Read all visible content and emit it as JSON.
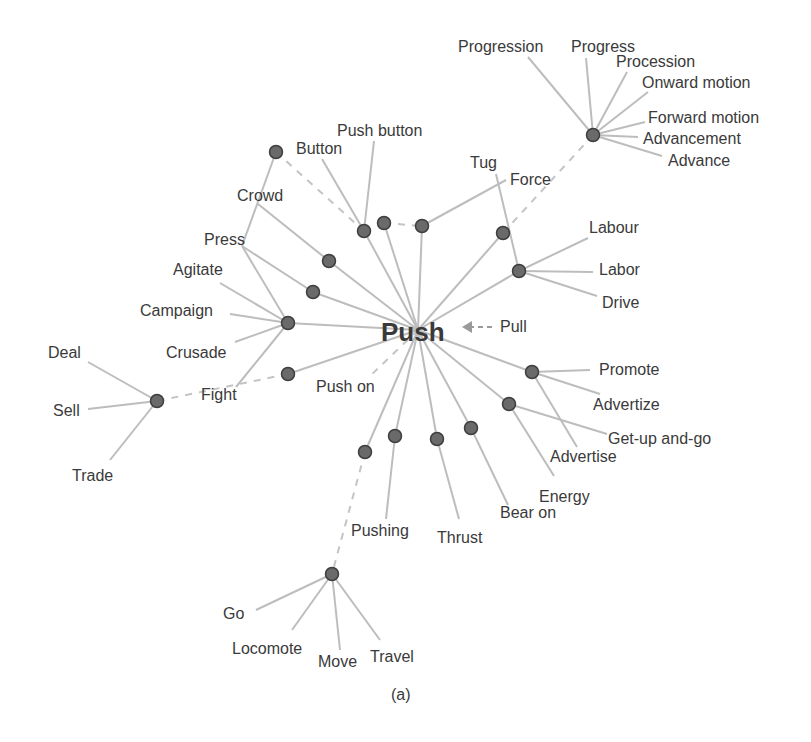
{
  "diagram": {
    "caption": "(a)",
    "center": {
      "id": "push",
      "label": "Push",
      "x": 418,
      "y": 330
    },
    "antonym": {
      "label": "Pull",
      "x": 500,
      "y": 332,
      "arrow_from": [
        492,
        327
      ],
      "arrow_to": [
        462,
        327
      ]
    },
    "colors": {
      "edge": "#bdbdbd",
      "node_fill": "#6a6a6a",
      "node_stroke": "#3e3e3e",
      "text": "#3a3a3a"
    },
    "nodes": [
      {
        "id": "n_crowd_hub",
        "x": 276,
        "y": 152
      },
      {
        "id": "n_button",
        "x": 364,
        "y": 231
      },
      {
        "id": "n_b2",
        "x": 384,
        "y": 223
      },
      {
        "id": "n_force",
        "x": 422,
        "y": 226
      },
      {
        "id": "n_tug",
        "x": 503,
        "y": 233
      },
      {
        "id": "n_labor",
        "x": 519,
        "y": 271
      },
      {
        "id": "n_progress",
        "x": 593,
        "y": 135
      },
      {
        "id": "n_crowd",
        "x": 329,
        "y": 261
      },
      {
        "id": "n_press",
        "x": 313,
        "y": 292
      },
      {
        "id": "n_campaign",
        "x": 288,
        "y": 323
      },
      {
        "id": "n_fight",
        "x": 288,
        "y": 374
      },
      {
        "id": "n_sell",
        "x": 157,
        "y": 401
      },
      {
        "id": "n_promote",
        "x": 532,
        "y": 372
      },
      {
        "id": "n_getup",
        "x": 509,
        "y": 404
      },
      {
        "id": "n_bearon",
        "x": 471,
        "y": 428
      },
      {
        "id": "n_thrust",
        "x": 437,
        "y": 439
      },
      {
        "id": "n_pushing",
        "x": 395,
        "y": 436
      },
      {
        "id": "n_pushon",
        "x": 365,
        "y": 452
      },
      {
        "id": "n_go",
        "x": 332,
        "y": 574
      }
    ],
    "words": [
      {
        "label": "Progression",
        "x": 458,
        "y": 52,
        "anchor": [
          528,
          57
        ]
      },
      {
        "label": "Progress",
        "x": 571,
        "y": 52,
        "anchor": [
          586,
          58
        ]
      },
      {
        "label": "Procession",
        "x": 616,
        "y": 67,
        "anchor": [
          627,
          72
        ]
      },
      {
        "label": "Onward motion",
        "x": 642,
        "y": 88,
        "anchor": [
          648,
          92
        ]
      },
      {
        "label": "Forward motion",
        "x": 648,
        "y": 123,
        "anchor": [
          645,
          122
        ]
      },
      {
        "label": "Advancement",
        "x": 643,
        "y": 144,
        "anchor": [
          638,
          137
        ]
      },
      {
        "label": "Advance",
        "x": 668,
        "y": 166,
        "anchor": [
          662,
          156
        ]
      },
      {
        "label": "Push button",
        "x": 337,
        "y": 136,
        "anchor": [
          374,
          141
        ]
      },
      {
        "label": "Button",
        "x": 296,
        "y": 154,
        "anchor": [
          322,
          159
        ]
      },
      {
        "label": "Tug",
        "x": 470,
        "y": 168,
        "anchor": [
          496,
          174
        ]
      },
      {
        "label": "Force",
        "x": 510,
        "y": 185,
        "anchor": [
          506,
          180
        ]
      },
      {
        "label": "Crowd",
        "x": 237,
        "y": 201,
        "anchor": [
          258,
          204
        ]
      },
      {
        "label": "Press",
        "x": 204,
        "y": 245,
        "anchor": [
          242,
          246
        ]
      },
      {
        "label": "Agitate",
        "x": 173,
        "y": 275,
        "anchor": [
          220,
          283
        ]
      },
      {
        "label": "Campaign",
        "x": 140,
        "y": 316,
        "anchor": [
          230,
          314
        ]
      },
      {
        "label": "Crusade",
        "x": 166,
        "y": 358,
        "anchor": [
          235,
          342
        ]
      },
      {
        "label": "Fight",
        "x": 201,
        "y": 400,
        "anchor": [
          236,
          387
        ]
      },
      {
        "label": "Deal",
        "x": 48,
        "y": 358,
        "anchor": [
          88,
          362
        ]
      },
      {
        "label": "Sell",
        "x": 53,
        "y": 416,
        "anchor": [
          88,
          409
        ]
      },
      {
        "label": "Trade",
        "x": 72,
        "y": 481,
        "anchor": [
          110,
          460
        ]
      },
      {
        "label": "Labour",
        "x": 589,
        "y": 233,
        "anchor": [
          588,
          238
        ]
      },
      {
        "label": "Labor",
        "x": 599,
        "y": 275,
        "anchor": [
          593,
          272
        ]
      },
      {
        "label": "Drive",
        "x": 602,
        "y": 308,
        "anchor": [
          597,
          296
        ]
      },
      {
        "label": "Push on",
        "x": 316,
        "y": 392,
        "anchor": null
      },
      {
        "label": "Promote",
        "x": 599,
        "y": 375,
        "anchor": [
          590,
          370
        ]
      },
      {
        "label": "Advertize",
        "x": 593,
        "y": 410,
        "anchor": [
          600,
          394
        ]
      },
      {
        "label": "Get-up and-go",
        "x": 608,
        "y": 444,
        "anchor": [
          607,
          434
        ]
      },
      {
        "label": "Advertise",
        "x": 550,
        "y": 462,
        "anchor": [
          577,
          447
        ]
      },
      {
        "label": "Energy",
        "x": 539,
        "y": 502,
        "anchor": [
          554,
          476
        ]
      },
      {
        "label": "Bear on",
        "x": 500,
        "y": 518,
        "anchor": [
          508,
          505
        ]
      },
      {
        "label": "Thrust",
        "x": 437,
        "y": 543,
        "anchor": [
          459,
          519
        ]
      },
      {
        "label": "Pushing",
        "x": 351,
        "y": 536,
        "anchor": [
          386,
          519
        ]
      },
      {
        "label": "Go",
        "x": 223,
        "y": 619,
        "anchor": [
          256,
          610
        ]
      },
      {
        "label": "Locomote",
        "x": 232,
        "y": 654,
        "anchor": [
          292,
          630
        ]
      },
      {
        "label": "Move",
        "x": 318,
        "y": 667,
        "anchor": [
          340,
          650
        ]
      },
      {
        "label": "Travel",
        "x": 370,
        "y": 662,
        "anchor": [
          380,
          640
        ]
      }
    ],
    "edges": [
      {
        "from": [
          418,
          330
        ],
        "to": [
          329,
          261
        ]
      },
      {
        "from": [
          418,
          330
        ],
        "to": [
          313,
          292
        ]
      },
      {
        "from": [
          418,
          330
        ],
        "to": [
          288,
          323
        ]
      },
      {
        "from": [
          418,
          330
        ],
        "to": [
          288,
          374
        ]
      },
      {
        "from": [
          418,
          330
        ],
        "to": [
          364,
          231
        ]
      },
      {
        "from": [
          418,
          330
        ],
        "to": [
          384,
          223
        ]
      },
      {
        "from": [
          418,
          330
        ],
        "to": [
          422,
          226
        ]
      },
      {
        "from": [
          418,
          330
        ],
        "to": [
          503,
          233
        ]
      },
      {
        "from": [
          418,
          330
        ],
        "to": [
          519,
          271
        ]
      },
      {
        "from": [
          418,
          330
        ],
        "to": [
          532,
          372
        ]
      },
      {
        "from": [
          418,
          330
        ],
        "to": [
          509,
          404
        ]
      },
      {
        "from": [
          418,
          330
        ],
        "to": [
          471,
          428
        ]
      },
      {
        "from": [
          418,
          330
        ],
        "to": [
          437,
          439
        ]
      },
      {
        "from": [
          418,
          330
        ],
        "to": [
          395,
          436
        ]
      },
      {
        "from": [
          418,
          330
        ],
        "to": [
          365,
          452
        ]
      },
      {
        "from": [
          329,
          261
        ],
        "to": [
          258,
          204
        ]
      },
      {
        "from": [
          313,
          292
        ],
        "to": [
          242,
          246
        ]
      },
      {
        "from": [
          288,
          323
        ],
        "to": [
          220,
          283
        ]
      },
      {
        "from": [
          288,
          323
        ],
        "to": [
          230,
          314
        ]
      },
      {
        "from": [
          288,
          323
        ],
        "to": [
          235,
          342
        ]
      },
      {
        "from": [
          288,
          323
        ],
        "to": [
          236,
          387
        ]
      },
      {
        "from": [
          288,
          323
        ],
        "to": [
          242,
          246
        ]
      },
      {
        "from": [
          242,
          246
        ],
        "to": [
          276,
          152
        ]
      },
      {
        "from": [
          364,
          231
        ],
        "to": [
          322,
          159
        ]
      },
      {
        "from": [
          364,
          231
        ],
        "to": [
          374,
          141
        ]
      },
      {
        "from": [
          422,
          226
        ],
        "to": [
          506,
          180
        ]
      },
      {
        "from": [
          519,
          271
        ],
        "to": [
          496,
          174
        ]
      },
      {
        "from": [
          519,
          271
        ],
        "to": [
          588,
          238
        ]
      },
      {
        "from": [
          519,
          271
        ],
        "to": [
          593,
          272
        ]
      },
      {
        "from": [
          519,
          271
        ],
        "to": [
          597,
          296
        ]
      },
      {
        "from": [
          157,
          401
        ],
        "to": [
          88,
          362
        ]
      },
      {
        "from": [
          157,
          401
        ],
        "to": [
          88,
          409
        ]
      },
      {
        "from": [
          157,
          401
        ],
        "to": [
          110,
          460
        ]
      },
      {
        "from": [
          593,
          135
        ],
        "to": [
          528,
          57
        ]
      },
      {
        "from": [
          593,
          135
        ],
        "to": [
          586,
          58
        ]
      },
      {
        "from": [
          593,
          135
        ],
        "to": [
          627,
          72
        ]
      },
      {
        "from": [
          593,
          135
        ],
        "to": [
          648,
          92
        ]
      },
      {
        "from": [
          593,
          135
        ],
        "to": [
          645,
          122
        ]
      },
      {
        "from": [
          593,
          135
        ],
        "to": [
          638,
          137
        ]
      },
      {
        "from": [
          593,
          135
        ],
        "to": [
          662,
          156
        ]
      },
      {
        "from": [
          532,
          372
        ],
        "to": [
          590,
          370
        ]
      },
      {
        "from": [
          532,
          372
        ],
        "to": [
          600,
          394
        ]
      },
      {
        "from": [
          532,
          372
        ],
        "to": [
          577,
          447
        ]
      },
      {
        "from": [
          509,
          404
        ],
        "to": [
          607,
          434
        ]
      },
      {
        "from": [
          509,
          404
        ],
        "to": [
          554,
          476
        ]
      },
      {
        "from": [
          471,
          428
        ],
        "to": [
          508,
          505
        ]
      },
      {
        "from": [
          437,
          439
        ],
        "to": [
          459,
          519
        ]
      },
      {
        "from": [
          395,
          436
        ],
        "to": [
          386,
          519
        ]
      },
      {
        "from": [
          332,
          574
        ],
        "to": [
          256,
          610
        ]
      },
      {
        "from": [
          332,
          574
        ],
        "to": [
          292,
          630
        ]
      },
      {
        "from": [
          332,
          574
        ],
        "to": [
          340,
          650
        ]
      },
      {
        "from": [
          332,
          574
        ],
        "to": [
          380,
          640
        ]
      }
    ],
    "dashed_edges": [
      {
        "from": [
          276,
          152
        ],
        "to": [
          364,
          231
        ]
      },
      {
        "from": [
          384,
          223
        ],
        "to": [
          422,
          226
        ]
      },
      {
        "from": [
          503,
          233
        ],
        "to": [
          593,
          135
        ]
      },
      {
        "from": [
          288,
          374
        ],
        "to": [
          157,
          401
        ]
      },
      {
        "from": [
          365,
          452
        ],
        "to": [
          332,
          574
        ]
      },
      {
        "from": [
          418,
          330
        ],
        "to": [
          368,
          378
        ]
      }
    ]
  }
}
